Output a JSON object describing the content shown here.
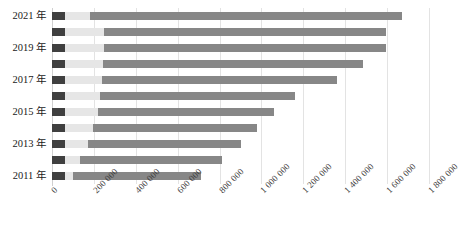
{
  "chart_data": {
    "type": "bar",
    "orientation": "horizontal",
    "stacked": true,
    "title": "",
    "subtitle": "",
    "xlabel": "",
    "ylabel": "",
    "grid": true,
    "legend": "none",
    "xlim": [
      0,
      1800000
    ],
    "xticks": [
      0,
      200000,
      400000,
      600000,
      800000,
      1000000,
      1200000,
      1400000,
      1600000,
      1800000
    ],
    "xtick_labels": [
      "0",
      "200 000",
      "400 000",
      "600 000",
      "800 000",
      "1 000 000",
      "1 200 000",
      "1 400 000",
      "1 600 000",
      "1 800 000"
    ],
    "categories": [
      "2011 年",
      "2012 年",
      "2013 年",
      "2014 年",
      "2015 年",
      "2016 年",
      "2017 年",
      "2018 年",
      "2019 年",
      "2020 年",
      "2021 年"
    ],
    "visible_ytick_labels": [
      "2011 年",
      "2013 年",
      "2015 年",
      "2017 年",
      "2019 年",
      "2021 年"
    ],
    "series": [
      {
        "name": "segment-1",
        "color": "#3f3f3f",
        "values": [
          62000,
          62000,
          62000,
          62000,
          62000,
          62000,
          62000,
          62000,
          62000,
          62000,
          62000
        ]
      },
      {
        "name": "segment-2",
        "color": "#e6e6e6",
        "values": [
          36000,
          72000,
          110000,
          134000,
          158000,
          168000,
          178000,
          182000,
          186000,
          188000,
          120000
        ]
      },
      {
        "name": "segment-3",
        "color": "#878787",
        "values": [
          612000,
          676000,
          730000,
          782000,
          840000,
          930000,
          1122000,
          1243000,
          1349000,
          1347000,
          1487000
        ]
      }
    ],
    "totals": [
      710000,
      810000,
      902000,
      978000,
      1060000,
      1160000,
      1362000,
      1487000,
      1597000,
      1597000,
      1669000
    ]
  },
  "colors": {
    "segment_dark": "#3f3f3f",
    "segment_light": "#e6e6e6",
    "segment_mid": "#878787",
    "gridline": "#e3e3e3",
    "axis": "#d0d0d0",
    "text": "#1a1a1a"
  }
}
